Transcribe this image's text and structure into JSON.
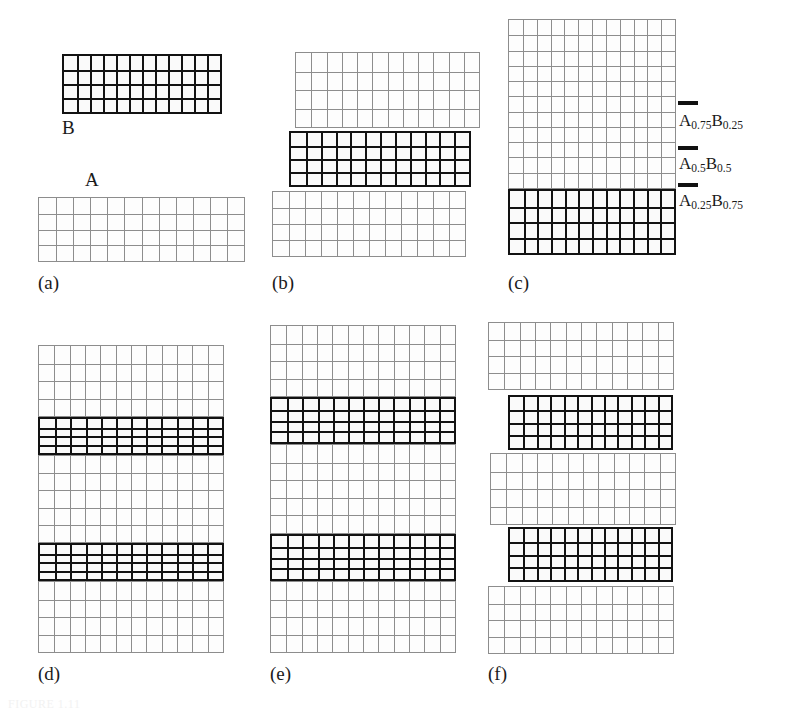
{
  "figure": {
    "kind": "crystal-lattice-superlattice-diagram",
    "caption_partial": "FIGURE 1.11",
    "material_labels": {
      "substrate_A": "A",
      "overlayer_B": "B"
    },
    "composition_annotations": [
      {
        "id": "a075b025",
        "text": "A0.75B0.25",
        "base": "A",
        "sub1": "0.75",
        "base2": "B",
        "sub2": "0.25"
      },
      {
        "id": "a05b05",
        "text": "A0.5B0.5",
        "base": "A",
        "sub1": "0.5",
        "base2": "B",
        "sub2": "0.5"
      },
      {
        "id": "a025b075",
        "text": "A0.25B0.75",
        "base": "A",
        "sub1": "0.25",
        "base2": "B",
        "sub2": "0.75"
      }
    ],
    "panels": [
      {
        "id": "a",
        "label": "(a)"
      },
      {
        "id": "b",
        "label": "(b)"
      },
      {
        "id": "c",
        "label": "(c)"
      },
      {
        "id": "d",
        "label": "(d)"
      },
      {
        "id": "e",
        "label": "(e)"
      },
      {
        "id": "f",
        "label": "(f)"
      }
    ],
    "colors": {
      "lattice_light_line": "#8d8d8d",
      "lattice_dark_line": "#121212",
      "background": "#ffffff",
      "text": "#1a1a1a"
    },
    "lattice_blocks": {
      "panel_a": [
        {
          "name": "b-overlayer",
          "type": "dark",
          "cols": 12,
          "rows": 4
        },
        {
          "name": "a-substrate",
          "type": "light",
          "cols": 12,
          "rows": 4
        }
      ],
      "panel_b": [
        {
          "name": "top-light",
          "type": "light",
          "cols": 12,
          "rows": 4
        },
        {
          "name": "mid-dark",
          "type": "dark",
          "cols": 12,
          "rows": 4
        },
        {
          "name": "bot-light",
          "type": "light",
          "cols": 12,
          "rows": 4
        }
      ],
      "panel_c": [
        {
          "name": "top-light",
          "type": "light",
          "cols": 12,
          "rows": 11
        },
        {
          "name": "bot-dark",
          "type": "dark",
          "cols": 12,
          "rows": 4
        }
      ],
      "panel_d": [
        {
          "name": "light-1",
          "type": "light",
          "cols": 12,
          "rows": 4
        },
        {
          "name": "dark-1",
          "type": "dark",
          "cols": 12,
          "rows": 4
        },
        {
          "name": "light-2",
          "type": "light",
          "cols": 12,
          "rows": 5
        },
        {
          "name": "dark-2",
          "type": "dark",
          "cols": 12,
          "rows": 4
        },
        {
          "name": "light-3",
          "type": "light",
          "cols": 12,
          "rows": 4
        }
      ],
      "panel_e": [
        {
          "name": "light-1",
          "type": "light",
          "cols": 12,
          "rows": 4
        },
        {
          "name": "dark-1",
          "type": "dark",
          "cols": 12,
          "rows": 4
        },
        {
          "name": "light-2",
          "type": "light",
          "cols": 12,
          "rows": 5
        },
        {
          "name": "dark-2",
          "type": "dark",
          "cols": 12,
          "rows": 4
        },
        {
          "name": "light-3",
          "type": "light",
          "cols": 12,
          "rows": 4
        }
      ],
      "panel_f": [
        {
          "name": "light-1",
          "type": "light",
          "cols": 12,
          "rows": 4
        },
        {
          "name": "dark-1",
          "type": "dark",
          "cols": 12,
          "rows": 4
        },
        {
          "name": "light-2",
          "type": "light",
          "cols": 12,
          "rows": 4
        },
        {
          "name": "dark-2",
          "type": "dark",
          "cols": 12,
          "rows": 4
        },
        {
          "name": "light-3",
          "type": "light",
          "cols": 12,
          "rows": 4
        }
      ]
    }
  }
}
